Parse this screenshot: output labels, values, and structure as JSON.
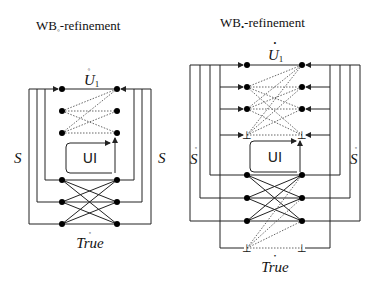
{
  "left_diagram": {
    "title_main": "WB",
    "title_sub": "◦",
    "title_suffix": "-refinement",
    "top_label": "U",
    "top_label_sub": "1",
    "top_accent": "◦",
    "side_label_left": "S",
    "side_label_right": "S",
    "box_label": "UI",
    "bottom_label": "True",
    "bottom_accent": "◦"
  },
  "right_diagram": {
    "title_main": "WB",
    "title_sub": "•",
    "title_suffix": "-refinement",
    "top_label": "U",
    "top_label_sub": "1",
    "top_accent": "•",
    "side_label_left": "S",
    "side_label_right": "S",
    "side_accent": "◦",
    "box_label": "UI",
    "bottom_label": "True",
    "bottom_accent": "•",
    "bottom_symbol": "⊥"
  }
}
